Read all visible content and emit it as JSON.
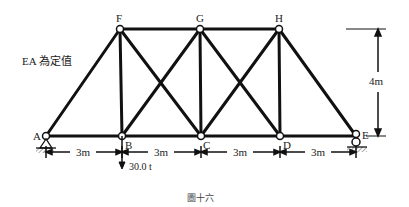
{
  "diagram": {
    "type": "truss",
    "note": "EA 為定值",
    "caption": "圖十六",
    "nodes": {
      "A": {
        "label": "A"
      },
      "B": {
        "label": "B"
      },
      "C": {
        "label": "C"
      },
      "D": {
        "label": "D"
      },
      "E": {
        "label": "E"
      },
      "F": {
        "label": "F"
      },
      "G": {
        "label": "G"
      },
      "H": {
        "label": "H"
      }
    },
    "members": [
      "AB",
      "BC",
      "CD",
      "DE",
      "FG",
      "GH",
      "AF",
      "FB",
      "GC",
      "HD",
      "HE",
      "FC",
      "GB",
      "GD",
      "HC"
    ],
    "supports": {
      "A": "pin",
      "E": "roller"
    },
    "load": {
      "node": "B",
      "label": "30.0 t",
      "direction": "down"
    },
    "dimensions": {
      "spans": [
        "3m",
        "3m",
        "3m",
        "3m"
      ],
      "height": "4m"
    }
  }
}
